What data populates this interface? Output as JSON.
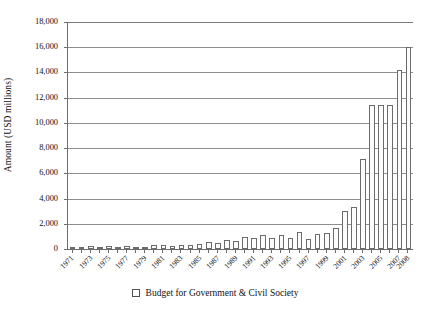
{
  "chart_data": {
    "type": "bar",
    "title": "",
    "xlabel": "",
    "ylabel": "Amount (USD millions)",
    "ylim": [
      0,
      18000
    ],
    "ytick_values": [
      0,
      2000,
      4000,
      6000,
      8000,
      10000,
      12000,
      14000,
      16000,
      18000
    ],
    "ytick_labels": [
      "0",
      "2,000",
      "4,000",
      "6,000",
      "8,000",
      "10,000",
      "12,000",
      "14,000",
      "16,000",
      "18,000"
    ],
    "grid": true,
    "legend_position": "bottom-center",
    "legend": [
      "Budget for Government & Civil Society"
    ],
    "series_name": "Budget for Government & Civil Society",
    "bar_face_color": "#fcfcfc",
    "bar_edge_color": "#6b6b6b",
    "categories": [
      "1971",
      "1972",
      "1973",
      "1974",
      "1975",
      "1976",
      "1977",
      "1978",
      "1979",
      "1980",
      "1981",
      "1982",
      "1983",
      "1984",
      "1985",
      "1986",
      "1987",
      "1988",
      "1989",
      "1990",
      "1991",
      "1992",
      "1993",
      "1994",
      "1995",
      "1996",
      "1997",
      "1998",
      "1999",
      "2000",
      "2001",
      "2002",
      "2003",
      "2004",
      "2005",
      "2006",
      "2007",
      "2008"
    ],
    "xtick_labels": [
      "1971",
      "1973",
      "1975",
      "1977",
      "1979",
      "1981",
      "1983",
      "1985",
      "1987",
      "1989",
      "1991",
      "1993",
      "1995",
      "1997",
      "1999",
      "2001",
      "2003",
      "2005",
      "2007",
      "2008"
    ],
    "values": [
      80,
      150,
      230,
      180,
      240,
      170,
      200,
      160,
      150,
      330,
      300,
      230,
      320,
      340,
      420,
      550,
      480,
      740,
      640,
      980,
      880,
      1150,
      860,
      1080,
      900,
      1350,
      760,
      1220,
      1280,
      1700,
      3050,
      3350,
      7150,
      11400,
      11450,
      11400,
      14200,
      16050
    ]
  }
}
